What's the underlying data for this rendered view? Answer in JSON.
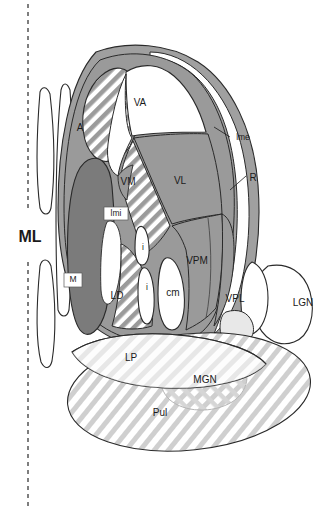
{
  "figure": {
    "kind": "anatomical-schematic",
    "background_color": "#ffffff",
    "width": 335,
    "height": 512
  },
  "palette": {
    "ink": "#1b1b1b",
    "outline": "#2a2a2a",
    "mid_gray": "#9a9a9a",
    "dark_gray": "#7b7b7b",
    "band_gray": "#a0a0a0",
    "hatch_gray": "#9b9b9b",
    "hatch_light": "#c9c9c9",
    "white": "#ffffff"
  },
  "midline": {
    "label": "ML",
    "name": "midline-dashed-axis",
    "dash_pattern": "4 4",
    "x": 28
  },
  "labels": [
    {
      "id": "ML",
      "text": "ML",
      "x": 30,
      "y": 238,
      "size": "big",
      "name": "label-ml"
    },
    {
      "id": "A",
      "text": "A",
      "x": 80,
      "y": 128,
      "size": "md",
      "name": "label-a"
    },
    {
      "id": "VA",
      "text": "VA",
      "x": 140,
      "y": 103,
      "size": "md",
      "name": "label-va"
    },
    {
      "id": "VM",
      "text": "VM",
      "x": 128,
      "y": 182,
      "size": "md",
      "name": "label-vm"
    },
    {
      "id": "VL",
      "text": "VL",
      "x": 180,
      "y": 181,
      "size": "md",
      "name": "label-vl"
    },
    {
      "id": "lme",
      "text": "lme",
      "x": 243,
      "y": 138,
      "size": "sm",
      "name": "label-lme"
    },
    {
      "id": "R",
      "text": "R",
      "x": 253,
      "y": 178,
      "size": "md",
      "name": "label-r"
    },
    {
      "id": "lmi",
      "text": "lmi",
      "x": 116,
      "y": 214,
      "size": "box",
      "name": "label-lmi"
    },
    {
      "id": "M",
      "text": "M",
      "x": 73,
      "y": 280,
      "size": "box",
      "name": "label-m"
    },
    {
      "id": "i1",
      "text": "i",
      "x": 143,
      "y": 248,
      "size": "sm",
      "name": "label-i-upper"
    },
    {
      "id": "i2",
      "text": "i",
      "x": 147,
      "y": 288,
      "size": "sm",
      "name": "label-i-lower"
    },
    {
      "id": "cm",
      "text": "cm",
      "x": 173,
      "y": 293,
      "size": "md",
      "name": "label-cm"
    },
    {
      "id": "LD",
      "text": "LD",
      "x": 117,
      "y": 296,
      "size": "md",
      "name": "label-ld"
    },
    {
      "id": "VPM",
      "text": "VPM",
      "x": 197,
      "y": 261,
      "size": "md",
      "name": "label-vpm"
    },
    {
      "id": "VPL",
      "text": "VPL",
      "x": 235,
      "y": 299,
      "size": "md",
      "name": "label-vpl"
    },
    {
      "id": "LGN",
      "text": "LGN",
      "x": 303,
      "y": 303,
      "size": "md",
      "name": "label-lgn"
    },
    {
      "id": "LP",
      "text": "LP",
      "x": 131,
      "y": 358,
      "size": "md",
      "name": "label-lp"
    },
    {
      "id": "MGN",
      "text": "MGN",
      "x": 205,
      "y": 380,
      "size": "md",
      "name": "label-mgn"
    },
    {
      "id": "Pul",
      "text": "Pul",
      "x": 160,
      "y": 413,
      "size": "md",
      "name": "label-pul"
    }
  ],
  "legend_terms": {
    "ML": "midline",
    "A": "anterior nuclei",
    "VA": "ventral anterior nucleus",
    "VL": "ventral lateral nucleus",
    "VM": "ventral medial nucleus",
    "VPM": "ventral posteromedial nucleus",
    "VPL": "ventral posterolateral nucleus",
    "M": "medial nucleus",
    "LD": "lateral dorsal nucleus",
    "LP": "lateral posterior nucleus",
    "Pul": "pulvinar",
    "MGN": "medial geniculate nucleus",
    "LGN": "lateral geniculate nucleus",
    "cm": "centromedian nucleus",
    "i": "intralaminar nuclei",
    "lme": "lamina medullaris externa",
    "lmi": "lamina medullaris interna",
    "R": "reticular nucleus"
  },
  "leaders": [
    {
      "name": "leader-lme",
      "from_x": 228,
      "from_y": 140,
      "to_x": 214,
      "to_y": 129
    },
    {
      "name": "leader-r",
      "from_x": 246,
      "from_y": 180,
      "to_x": 231,
      "to_y": 190
    }
  ]
}
